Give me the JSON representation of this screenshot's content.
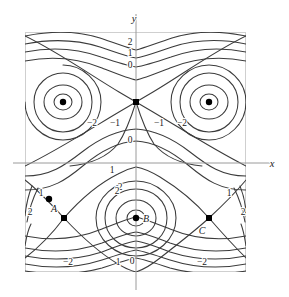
{
  "figure": {
    "background_color": "#ffffff",
    "frame_color": "#cfcfcf",
    "contour_color": "#3b3b3b",
    "axis_color": "#9a9a9a",
    "marker_color": "#000000"
  },
  "chart_data": {
    "type": "line",
    "subtype": "contour",
    "title": "",
    "xlabel": "x",
    "ylabel": "y",
    "grid": false,
    "legend": false,
    "contour_levels": [
      -2,
      -1,
      0,
      1,
      2
    ],
    "axes": {
      "x_axis_label": "x",
      "y_axis_label": "y",
      "x_axis_label_position": "right",
      "y_axis_label_position": "top",
      "x_axis_pixel_y": 163,
      "y_axis_pixel_x": 136
    },
    "frame": {
      "left": 25,
      "top": 32,
      "right": 246,
      "bottom": 272
    },
    "contour_labels": [
      {
        "text": "2",
        "x": 130,
        "y": 45
      },
      {
        "text": "1",
        "x": 130,
        "y": 56
      },
      {
        "text": "0",
        "x": 130,
        "y": 68
      },
      {
        "text": "−2",
        "x": 92,
        "y": 126
      },
      {
        "text": "−1",
        "x": 115,
        "y": 126
      },
      {
        "text": "−1",
        "x": 159,
        "y": 126
      },
      {
        "text": "−2",
        "x": 182,
        "y": 126
      },
      {
        "text": "0",
        "x": 130,
        "y": 143
      },
      {
        "text": "1",
        "x": 112,
        "y": 173
      },
      {
        "text": "2",
        "x": 120,
        "y": 190
      },
      {
        "text": "1",
        "x": 41,
        "y": 196
      },
      {
        "text": "2",
        "x": 30,
        "y": 215
      },
      {
        "text": "2",
        "x": 117,
        "y": 194
      },
      {
        "text": "1",
        "x": 229,
        "y": 196
      },
      {
        "text": "2",
        "x": 243,
        "y": 215
      },
      {
        "text": "−2",
        "x": 68,
        "y": 265
      },
      {
        "text": "1",
        "x": 118,
        "y": 265
      },
      {
        "text": "0",
        "x": 132,
        "y": 264
      },
      {
        "text": "−2",
        "x": 202,
        "y": 265
      }
    ],
    "marked_points": [
      {
        "name": "center-upper-left",
        "label": "",
        "x": 63,
        "y": 102,
        "kind": "center"
      },
      {
        "name": "saddle-upper-mid",
        "label": "",
        "x": 136,
        "y": 102,
        "kind": "saddle"
      },
      {
        "name": "center-upper-right",
        "label": "",
        "x": 209,
        "y": 102,
        "kind": "center"
      },
      {
        "name": "point-a",
        "label": "A",
        "x": 49,
        "y": 199,
        "kind": "point"
      },
      {
        "name": "saddle-lower-left",
        "label": "",
        "x": 64,
        "y": 218,
        "kind": "saddle"
      },
      {
        "name": "center-b",
        "label": "B",
        "x": 136,
        "y": 218,
        "kind": "center"
      },
      {
        "name": "saddle-c",
        "label": "C",
        "x": 209,
        "y": 218,
        "kind": "saddle"
      }
    ],
    "point_labels": [
      {
        "text": "A",
        "x": 54,
        "y": 212
      },
      {
        "text": "B",
        "x": 146,
        "y": 222
      },
      {
        "text": "C",
        "x": 202,
        "y": 234
      }
    ],
    "axis_tick_labels": {
      "top_group": [
        "2",
        "1",
        "0"
      ],
      "upper_middle_left": [
        "−2",
        "−1"
      ],
      "upper_middle_right": [
        "−1",
        "−2"
      ],
      "mid": [
        "0"
      ],
      "lower": [
        "1",
        "2"
      ],
      "bottom_group": [
        "−2",
        "1",
        "0",
        "−2"
      ]
    }
  }
}
